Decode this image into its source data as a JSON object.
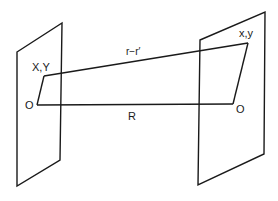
{
  "diagram": {
    "labels": {
      "left_point": "X,Y",
      "left_origin": "O",
      "separation_vector": "r−r′",
      "baseline": "R",
      "right_point": "x,y",
      "right_origin": "O"
    },
    "elements": {
      "left_plane": {
        "points": [
          [
            17,
            52
          ],
          [
            62,
            23
          ],
          [
            60,
            160
          ],
          [
            17,
            186
          ]
        ]
      },
      "right_plane": {
        "points": [
          [
            200,
            40
          ],
          [
            265,
            12
          ],
          [
            264,
            154
          ],
          [
            198,
            185
          ]
        ]
      },
      "left_point_pos": [
        44,
        76
      ],
      "left_origin_pos": [
        37,
        105
      ],
      "right_point_pos": [
        248,
        43
      ],
      "right_origin_pos": [
        233,
        104
      ]
    },
    "colors": {
      "stroke": "#1a1a1a",
      "background": "#ffffff"
    }
  }
}
